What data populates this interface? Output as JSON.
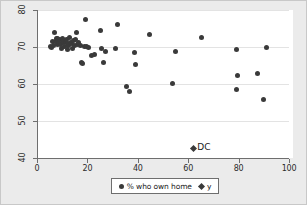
{
  "chart_data": {
    "type": "scatter",
    "title": "",
    "xlabel": "",
    "ylabel": "",
    "xlim": [
      0,
      100
    ],
    "ylim": [
      40,
      80
    ],
    "xticks": [
      "0",
      "20",
      "40",
      "60",
      "80",
      "100"
    ],
    "yticks": [
      "80",
      "70",
      "60",
      "50",
      "40"
    ],
    "grid": "horizontal",
    "legend_position": "bottom-center",
    "series": [
      {
        "name": "% who own home",
        "marker": "circle",
        "color": "#3a3a3a",
        "points": [
          [
            5.3,
            70.1
          ],
          [
            5.6,
            69.9
          ],
          [
            6.1,
            71.5
          ],
          [
            6.4,
            70.4
          ],
          [
            7.0,
            74.0
          ],
          [
            7.3,
            71.4
          ],
          [
            7.6,
            72.4
          ],
          [
            8.0,
            70.6
          ],
          [
            8.3,
            72.2
          ],
          [
            8.6,
            71.1
          ],
          [
            9.0,
            72.0
          ],
          [
            9.3,
            70.8
          ],
          [
            9.6,
            69.6
          ],
          [
            10.0,
            71.8
          ],
          [
            10.3,
            72.3
          ],
          [
            10.6,
            71.2
          ],
          [
            11.0,
            70.2
          ],
          [
            11.3,
            71.6
          ],
          [
            11.6,
            72.1
          ],
          [
            12.0,
            69.4
          ],
          [
            12.3,
            71.0
          ],
          [
            12.6,
            70.5
          ],
          [
            13.0,
            72.6
          ],
          [
            13.4,
            71.3
          ],
          [
            13.8,
            70.9
          ],
          [
            14.2,
            69.7
          ],
          [
            14.6,
            71.7
          ],
          [
            15.0,
            70.3
          ],
          [
            15.4,
            72.0
          ],
          [
            15.8,
            73.8
          ],
          [
            16.2,
            70.7
          ],
          [
            16.6,
            71.1
          ],
          [
            17.2,
            70.4
          ],
          [
            17.6,
            65.8
          ],
          [
            18.2,
            65.6
          ],
          [
            18.8,
            70.2
          ],
          [
            19.2,
            77.3
          ],
          [
            19.8,
            70.1
          ],
          [
            20.6,
            70.0
          ],
          [
            21.8,
            67.6
          ],
          [
            23.0,
            68.0
          ],
          [
            25.2,
            74.4
          ],
          [
            25.6,
            69.6
          ],
          [
            26.4,
            65.8
          ],
          [
            27.2,
            68.9
          ],
          [
            31.2,
            69.7
          ],
          [
            31.8,
            76.0
          ],
          [
            35.6,
            59.4
          ],
          [
            36.6,
            58.1
          ],
          [
            38.8,
            68.4
          ],
          [
            39.2,
            65.2
          ],
          [
            44.6,
            73.4
          ],
          [
            53.8,
            60.1
          ],
          [
            54.8,
            68.7
          ],
          [
            65.2,
            72.7
          ],
          [
            79.0,
            69.2
          ],
          [
            79.4,
            62.2
          ],
          [
            79.0,
            58.5
          ],
          [
            87.4,
            62.9
          ],
          [
            89.8,
            55.9
          ],
          [
            91.0,
            69.8
          ]
        ]
      },
      {
        "name": "y",
        "marker": "diamond",
        "color": "#3a3a3a",
        "points": [
          [
            62.0,
            42.7
          ]
        ],
        "annotations": [
          {
            "x": 62.0,
            "y": 42.7,
            "text": "DC"
          }
        ]
      }
    ]
  },
  "legend": {
    "items": [
      {
        "label": "% who own home",
        "marker": "circle-marker"
      },
      {
        "label": "y",
        "marker": "diamond-marker"
      }
    ]
  },
  "annotation": {
    "dc_label": "DC"
  }
}
